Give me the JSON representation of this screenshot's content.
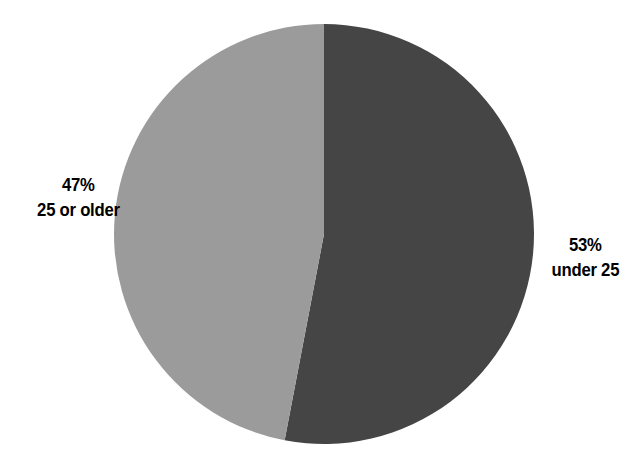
{
  "chart_data": {
    "type": "pie",
    "title": "",
    "subtitle": "",
    "xlabel": "",
    "ylabel": "",
    "legend_position": "none",
    "grid": false,
    "labels_inside": false,
    "start_angle_deg": 0,
    "direction": "clockwise",
    "categories": [
      "under 25",
      "25 or older"
    ],
    "values": [
      53,
      47
    ],
    "unit": "%",
    "slices": [
      {
        "name": "under 25",
        "percent_text": "53%",
        "value": 53,
        "color": "#454545",
        "sweep_deg": 190.8,
        "label_side": "right"
      },
      {
        "name": "25 or older",
        "percent_text": "47%",
        "value": 47,
        "color": "#9b9b9b",
        "sweep_deg": 169.2,
        "label_side": "left"
      }
    ]
  },
  "figure": {
    "background_color": "#ffffff",
    "text_color": "#000000",
    "center_x": 324,
    "center_y": 234,
    "radius": 210
  },
  "labels": {
    "left": {
      "percent": "47%",
      "category": "25 or older"
    },
    "right": {
      "percent": "53%",
      "category": "under 25"
    }
  }
}
